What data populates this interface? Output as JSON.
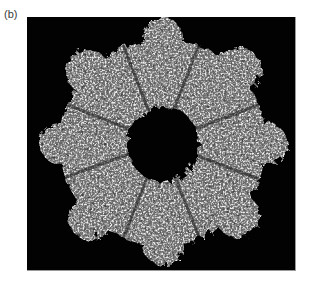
{
  "figure": {
    "panel_label": "(b)",
    "image": {
      "subject": "protein-ring-wireframe",
      "background_color": "#020202",
      "structure_color": "#c8c8c8",
      "lobe_count": 8
    }
  }
}
